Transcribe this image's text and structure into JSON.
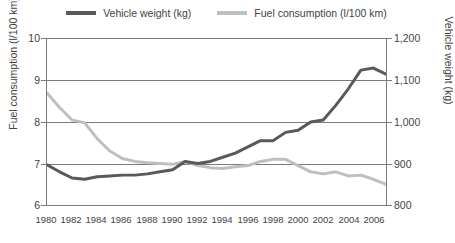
{
  "legend": {
    "position": "top-center",
    "items": [
      {
        "label": "Vehicle weight (kg)",
        "color": "#595959",
        "key": "vehicle_weight"
      },
      {
        "label": "Fuel consumption (l/100 km)",
        "color": "#bfbfbf",
        "key": "fuel_consumption"
      }
    ]
  },
  "axes": {
    "left": {
      "title": "Fuel consumption (l/100 km)",
      "ticks": [
        "10",
        "9",
        "8",
        "7",
        "6"
      ],
      "min": 6,
      "max": 10
    },
    "right": {
      "title": "Vehicle weight (kg)",
      "ticks": [
        "1,200",
        "1,100",
        "1,000",
        "900",
        "800"
      ],
      "min": 800,
      "max": 1200
    },
    "bottom": {
      "ticks": [
        "1980",
        "1982",
        "1984",
        "1986",
        "1988",
        "1990",
        "1992",
        "1994",
        "1996",
        "1998",
        "2000",
        "2002",
        "2004",
        "2006"
      ]
    }
  },
  "chart_data": {
    "type": "line",
    "title": "",
    "xlabel": "",
    "ylabel": "Fuel consumption (l/100 km)",
    "y2label": "Vehicle weight (kg)",
    "grid": true,
    "legend_position": "top-center",
    "xlim": [
      1980,
      2007
    ],
    "ylim": [
      6,
      10
    ],
    "y2lim": [
      800,
      1200
    ],
    "x": [
      1980,
      1981,
      1982,
      1983,
      1984,
      1985,
      1986,
      1987,
      1988,
      1989,
      1990,
      1991,
      1992,
      1993,
      1994,
      1995,
      1996,
      1997,
      1998,
      1999,
      2000,
      2001,
      2002,
      2003,
      2004,
      2005,
      2006,
      2007
    ],
    "series": [
      {
        "name": "Fuel consumption (l/100 km)",
        "axis": "left",
        "color": "#bfbfbf",
        "unit": "l/100 km",
        "values": [
          8.7,
          8.35,
          8.05,
          7.98,
          7.6,
          7.3,
          7.12,
          7.05,
          7.02,
          7.0,
          6.98,
          7.05,
          6.95,
          6.9,
          6.88,
          6.92,
          6.95,
          7.05,
          7.1,
          7.1,
          6.95,
          6.8,
          6.75,
          6.8,
          6.7,
          6.72,
          6.62,
          6.5
        ]
      },
      {
        "name": "Vehicle weight (kg)",
        "axis": "right",
        "color": "#595959",
        "unit": "kg",
        "values": [
          897,
          880,
          865,
          862,
          868,
          870,
          872,
          872,
          875,
          880,
          885,
          905,
          900,
          905,
          915,
          925,
          940,
          955,
          955,
          975,
          980,
          1000,
          1005,
          1040,
          1080,
          1125,
          1130,
          1115
        ]
      }
    ]
  }
}
